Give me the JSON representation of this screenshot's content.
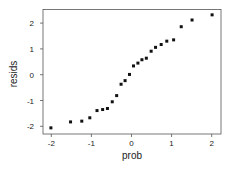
{
  "chart_data": {
    "type": "scatter",
    "title": "",
    "xlabel": "prob",
    "ylabel": "resids",
    "xlim": [
      -2.2,
      2.25
    ],
    "ylim": [
      -2.3,
      2.55
    ],
    "xticks": [
      -2,
      -1,
      0,
      1,
      2
    ],
    "yticks": [
      -2,
      -1,
      0,
      1,
      2
    ],
    "xtick_labels": [
      "-2",
      "-1",
      "0",
      "1",
      "2"
    ],
    "ytick_labels": [
      "-2",
      "-1",
      "0",
      "1",
      "2"
    ],
    "grid": false,
    "legend": null,
    "marker_color": "#111111",
    "series": [
      {
        "name": "resids vs prob",
        "x": [
          -2.01,
          -1.52,
          -1.24,
          -1.04,
          -0.86,
          -0.72,
          -0.6,
          -0.48,
          -0.37,
          -0.26,
          -0.16,
          -0.05,
          0.05,
          0.16,
          0.26,
          0.37,
          0.49,
          0.6,
          0.74,
          0.88,
          1.05,
          1.24,
          1.51,
          2.01
        ],
        "y": [
          -2.06,
          -1.83,
          -1.8,
          -1.67,
          -1.39,
          -1.35,
          -1.31,
          -1.05,
          -0.81,
          -0.37,
          -0.23,
          0.01,
          0.34,
          0.45,
          0.58,
          0.64,
          0.91,
          1.06,
          1.17,
          1.3,
          1.35,
          1.86,
          2.12,
          2.32
        ]
      }
    ]
  }
}
